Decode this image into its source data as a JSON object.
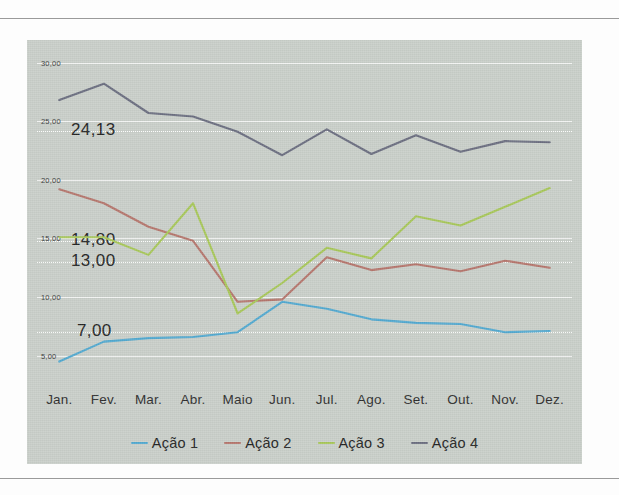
{
  "chart_data": {
    "type": "line",
    "title": "",
    "xlabel": "",
    "ylabel": "",
    "categories": [
      "Jan.",
      "Fev.",
      "Mar.",
      "Abr.",
      "Maio",
      "Jun.",
      "Jul.",
      "Ago.",
      "Set.",
      "Out.",
      "Nov.",
      "Dez."
    ],
    "ylim": [
      2.5,
      31.5
    ],
    "yticks": [
      30,
      25,
      20,
      15,
      10,
      5
    ],
    "ytick_labels": [
      "30,00",
      "25,00",
      "20,00",
      "15,00",
      "10,00",
      "5,00"
    ],
    "grid": true,
    "legend_position": "bottom",
    "annotations": [
      {
        "label": "24,13",
        "value": 24.13,
        "series": "Ação 4"
      },
      {
        "label": "14,80",
        "value": 14.8,
        "series": "Ação 3"
      },
      {
        "label": "13,00",
        "value": 13.0,
        "series": "Ação 2"
      },
      {
        "label": "7,00",
        "value": 7.0,
        "series": "Ação 1"
      }
    ],
    "series": [
      {
        "name": "Ação 1",
        "color": "#52a9d0",
        "values": [
          4.5,
          6.2,
          6.5,
          6.6,
          7.0,
          9.6,
          9.0,
          8.1,
          7.8,
          7.7,
          7.0,
          7.1
        ]
      },
      {
        "name": "Ação 2",
        "color": "#b5766d",
        "values": [
          19.2,
          18.0,
          16.0,
          14.8,
          9.6,
          9.8,
          13.4,
          12.3,
          12.8,
          12.2,
          13.1,
          12.5
        ]
      },
      {
        "name": "Ação 3",
        "color": "#a7c759",
        "values": [
          15.1,
          15.1,
          13.6,
          18.0,
          8.6,
          11.2,
          14.2,
          13.3,
          16.9,
          16.1,
          17.7,
          19.3
        ]
      },
      {
        "name": "Ação 4",
        "color": "#6b6e80",
        "values": [
          26.8,
          28.2,
          25.7,
          25.4,
          24.1,
          22.1,
          24.3,
          22.2,
          23.8,
          22.4,
          23.3,
          23.2
        ]
      }
    ]
  },
  "legend": {
    "items": [
      {
        "label": "Ação 1"
      },
      {
        "label": "Ação 2"
      },
      {
        "label": "Ação 3"
      },
      {
        "label": "Ação 4"
      }
    ]
  },
  "colors": {
    "panel_background": "#c9cfc9",
    "page_background": "#fdfdfd",
    "gridline": "#ffffff",
    "text": "#232323"
  }
}
